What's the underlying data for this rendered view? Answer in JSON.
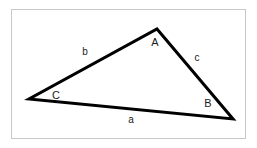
{
  "figure": {
    "kind": "geometry-diagram",
    "shape": "triangle",
    "background_color": "#ffffff",
    "frame": {
      "x": 11,
      "y": 9,
      "width": 235,
      "height": 130,
      "border_color": "#c8c8c8",
      "border_width": 1
    },
    "stroke_color": "#000000",
    "stroke_width": 3,
    "label_color": "#1a1a1a"
  },
  "vertices": [
    {
      "id": "A",
      "label": "A",
      "point_x": 157,
      "point_y": 29,
      "label_x": 155,
      "label_y": 42
    },
    {
      "id": "B",
      "label": "B",
      "point_x": 233,
      "point_y": 119,
      "label_x": 208,
      "label_y": 103
    },
    {
      "id": "C",
      "label": "C",
      "point_x": 29,
      "point_y": 99,
      "label_x": 56,
      "label_y": 95
    }
  ],
  "sides": [
    {
      "id": "a",
      "label": "a",
      "from": "C",
      "to": "B",
      "label_x": 131,
      "label_y": 120
    },
    {
      "id": "b",
      "label": "b",
      "from": "C",
      "to": "A",
      "label_x": 85,
      "label_y": 52
    },
    {
      "id": "c",
      "label": "c",
      "from": "A",
      "to": "B",
      "label_x": 197,
      "label_y": 58
    }
  ],
  "polygon_points": "157,29 233,119 29,99"
}
